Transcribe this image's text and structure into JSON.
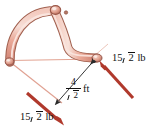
{
  "figure": {
    "background_color": "#ffffff",
    "member_color": "#e9a697",
    "member_outline_color": "#9c5c50",
    "member_highlight_color": "#f6d2c8",
    "force_color": "#b0392c",
    "construction_line_color": "#e2a392",
    "dimension_line_color": "#2a2a2a"
  },
  "forces": [
    {
      "id": "force-right",
      "magnitude": "15",
      "radicand": "2",
      "unit": "lb",
      "full_label": "15√2 lb",
      "direction": "up-left",
      "applied_at": "right-joint"
    },
    {
      "id": "force-left",
      "magnitude": "15",
      "radicand": "2",
      "unit": "lb",
      "full_label": "15√2 lb",
      "direction": "down-right",
      "applied_at": "lower-left-line"
    }
  ],
  "dimension": {
    "id": "span-dimension",
    "numerator": "4",
    "denominator_radicand": "2",
    "unit": "ft",
    "full_label": "4/√2 ft"
  },
  "joints": [
    {
      "id": "left-pin",
      "x": 9,
      "y": 61
    },
    {
      "id": "top-pin",
      "x": 56,
      "y": 11
    },
    {
      "id": "right-joint",
      "x": 98,
      "y": 58
    }
  ]
}
